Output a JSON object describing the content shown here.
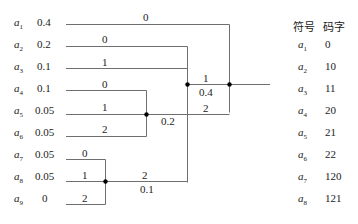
{
  "symbols": [
    {
      "name": "a",
      "sub": "1",
      "prob": "0.4"
    },
    {
      "name": "a",
      "sub": "2",
      "prob": "0.2"
    },
    {
      "name": "a",
      "sub": "3",
      "prob": "0.1"
    },
    {
      "name": "a",
      "sub": "4",
      "prob": "0.1"
    },
    {
      "name": "a",
      "sub": "5",
      "prob": "0.05"
    },
    {
      "name": "a",
      "sub": "6",
      "prob": "0.05"
    },
    {
      "name": "a",
      "sub": "7",
      "prob": "0.05"
    },
    {
      "name": "a",
      "sub": "8",
      "prob": "0.05"
    },
    {
      "name": "a",
      "sub": "9",
      "prob": "0"
    }
  ],
  "branch_labels": {
    "a1": "0",
    "a2": "0",
    "a3": "1",
    "a4": "0",
    "a5": "1",
    "a6": "2",
    "a7": "0",
    "a8": "1",
    "a9": "2",
    "group789_out": "2",
    "group789_prob": "0.1",
    "group456_out": "2",
    "group456_prob": "0.2",
    "inner_out": "1",
    "inner_prob": "0.4"
  },
  "table": {
    "header_symbol": "符号",
    "header_code": "码字",
    "rows": [
      {
        "name": "a",
        "sub": "1",
        "code": "0"
      },
      {
        "name": "a",
        "sub": "2",
        "code": "10"
      },
      {
        "name": "a",
        "sub": "3",
        "code": "11"
      },
      {
        "name": "a",
        "sub": "4",
        "code": "20"
      },
      {
        "name": "a",
        "sub": "5",
        "code": "21"
      },
      {
        "name": "a",
        "sub": "6",
        "code": "22"
      },
      {
        "name": "a",
        "sub": "7",
        "code": "120"
      },
      {
        "name": "a",
        "sub": "8",
        "code": "121"
      }
    ]
  },
  "colors": {
    "line": "#6f6f6f",
    "node": "#000000",
    "text": "#222222"
  }
}
